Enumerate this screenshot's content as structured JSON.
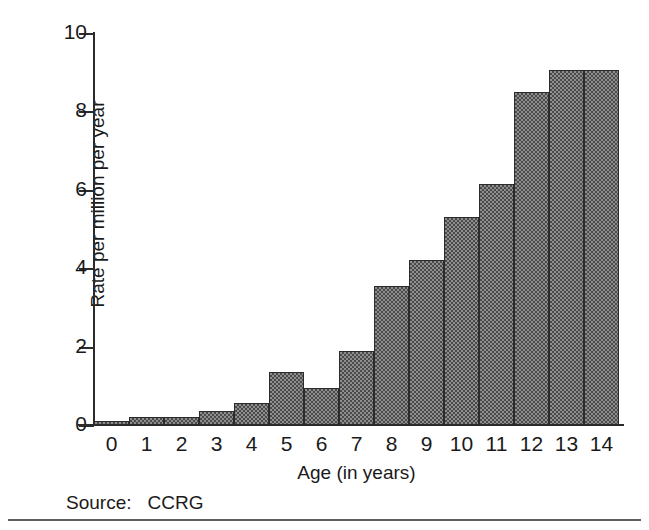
{
  "chart_data": {
    "type": "bar",
    "title": "",
    "xlabel": "Age (in years)",
    "ylabel": "Rate per million per year",
    "categories": [
      "0",
      "1",
      "2",
      "3",
      "4",
      "5",
      "6",
      "7",
      "8",
      "9",
      "10",
      "11",
      "12",
      "13",
      "14"
    ],
    "values": [
      0.1,
      0.2,
      0.2,
      0.35,
      0.55,
      1.35,
      0.95,
      1.9,
      3.55,
      4.2,
      5.3,
      6.15,
      8.5,
      9.05,
      9.05
    ],
    "bar_values": [
      {
        "age": "0",
        "rate": 0.1
      },
      {
        "age": "1",
        "rate": 0.2
      },
      {
        "age": "2",
        "rate": 0.2
      },
      {
        "age": "3",
        "rate": 0.35
      },
      {
        "age": "4",
        "rate": 0.55
      },
      {
        "age": "5",
        "rate": 1.35
      },
      {
        "age": "6",
        "rate": 0.95
      },
      {
        "age": "7",
        "rate": 1.9
      },
      {
        "age": "8",
        "rate": 3.55
      },
      {
        "age": "9",
        "rate": 4.2
      },
      {
        "age": "10",
        "rate": 5.3
      },
      {
        "age": "11",
        "rate": 6.15
      },
      {
        "age": "12",
        "rate": 8.5
      },
      {
        "age": "13",
        "rate": 9.05
      }
    ],
    "ylim": [
      0,
      10
    ],
    "yticks": [
      0,
      2,
      4,
      6,
      8,
      10
    ],
    "ytick_labels": [
      "0",
      "2",
      "4",
      "6",
      "8",
      "10"
    ],
    "xtick_labels": [
      "0",
      "1",
      "2",
      "3",
      "4",
      "5",
      "6",
      "7",
      "8",
      "9",
      "10",
      "11",
      "12",
      "13",
      "14"
    ],
    "grid": false,
    "legend": false,
    "legend_position": "none",
    "bar_fill_color": "#8e8e8e",
    "bar_edge_color": "#2b2b2b",
    "axis_color": "#2b2b2b"
  },
  "source": {
    "label": "Source:",
    "value": "CCRG"
  }
}
